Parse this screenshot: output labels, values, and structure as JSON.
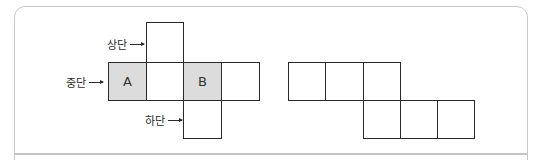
{
  "diagram": {
    "net1": {
      "labels": {
        "top": "상단",
        "middle": "중단",
        "bottom": "하단"
      },
      "cells": [
        {
          "id": "top",
          "text": "",
          "shaded": false
        },
        {
          "id": "mid1",
          "text": "A",
          "shaded": true
        },
        {
          "id": "mid2",
          "text": "",
          "shaded": false
        },
        {
          "id": "mid3",
          "text": "B",
          "shaded": true
        },
        {
          "id": "mid4",
          "text": "",
          "shaded": false
        },
        {
          "id": "bottom",
          "text": "",
          "shaded": false
        }
      ]
    },
    "net2": {
      "cells": [
        {
          "id": "r1c1",
          "text": ""
        },
        {
          "id": "r1c2",
          "text": ""
        },
        {
          "id": "r1c3",
          "text": ""
        },
        {
          "id": "r2c3",
          "text": ""
        },
        {
          "id": "r2c4",
          "text": ""
        },
        {
          "id": "r2c5",
          "text": ""
        }
      ]
    },
    "colors": {
      "line": "#2a2a2a",
      "shade": "#dcdcdc",
      "frame": "#c8c8c8"
    }
  }
}
